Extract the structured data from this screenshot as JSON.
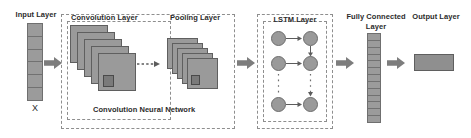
{
  "diagram": {
    "background_color": "#ffffff",
    "fill_color": "#9a9a9a",
    "stroke_color": "#5f5f5f",
    "dash_color": "#8e8e8e",
    "text_color": "#2b2b2b"
  },
  "labels": {
    "input_layer": "Input Layer",
    "input_symbol": "X",
    "convolution_layer": "Convolution Layer",
    "pooling_layer": "Pooling Layer",
    "cnn_caption": "Convolution Neural  Network",
    "lstm_layer": "LSTM Layer",
    "fully_connected_line1": "Fully Connected",
    "fully_connected_line2": "Layer",
    "output_layer": "Output Layer"
  },
  "structure": {
    "input_cells": 6,
    "convolution_maps": 5,
    "pooling_maps": 5,
    "fully_connected_cells": 13,
    "lstm_rows": 3,
    "lstm_columns": 2,
    "lstm_node_count": 6,
    "output_blocks": 1,
    "block_arrows": 4,
    "dashed_arrows": 1,
    "ellipsis_marks": 2
  },
  "icons": {
    "arrow": "block-right-arrow-icon",
    "dashed_arrow": "dashed-right-arrow-icon",
    "ellipsis": "vertical-ellipsis-icon",
    "kernel": "convolution-kernel-icon"
  }
}
